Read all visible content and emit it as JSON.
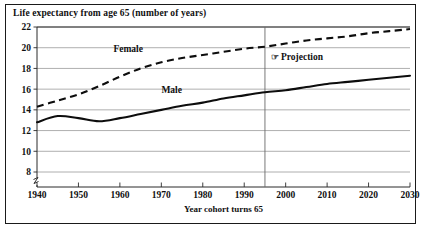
{
  "figure": {
    "title": "Life expectancy from age 65 (number of years)",
    "frame_color": "#1a1a1a",
    "background": "#ffffff"
  },
  "annotations": {
    "projection_label": "Projection",
    "projection_glyph": "☞",
    "projection_glyph_name": "pointing-hand-icon"
  },
  "chart_data": {
    "type": "line",
    "title": "Life expectancy from age 65 (number of years)",
    "xlabel": "Year cohort turns 65",
    "ylabel": "",
    "xlim": [
      1940,
      2030
    ],
    "ylim": [
      7,
      22
    ],
    "y_axis_break_below": 8,
    "grid": true,
    "legend_position": "inline-labels",
    "xticks": [
      1940,
      1950,
      1960,
      1970,
      1980,
      1990,
      2000,
      2010,
      2020,
      2030
    ],
    "xtick_labels": [
      "1940",
      "1950",
      "1960",
      "1970",
      "1980",
      "1990",
      "2000",
      "2010",
      "2020",
      "2030"
    ],
    "yticks": [
      8,
      10,
      12,
      14,
      16,
      18,
      20,
      22
    ],
    "ytick_labels": [
      "8",
      "10",
      "12",
      "14",
      "16",
      "18",
      "20",
      "22"
    ],
    "projection_divider_x": 1995,
    "series": [
      {
        "name": "Female",
        "style": "dashed",
        "label": "Female",
        "color": "#0d0d0d",
        "x": [
          1940,
          1945,
          1950,
          1955,
          1960,
          1965,
          1970,
          1975,
          1980,
          1985,
          1990,
          1995,
          2000,
          2005,
          2010,
          2015,
          2020,
          2025,
          2030
        ],
        "values": [
          14.3,
          14.9,
          15.5,
          16.3,
          17.2,
          18.0,
          18.6,
          19.0,
          19.3,
          19.6,
          19.9,
          20.1,
          20.4,
          20.7,
          20.9,
          21.1,
          21.4,
          21.6,
          21.8
        ]
      },
      {
        "name": "Male",
        "style": "solid",
        "label": "Male",
        "color": "#0d0d0d",
        "x": [
          1940,
          1945,
          1950,
          1955,
          1960,
          1965,
          1970,
          1975,
          1980,
          1985,
          1990,
          1995,
          2000,
          2005,
          2010,
          2015,
          2020,
          2025,
          2030
        ],
        "values": [
          12.8,
          13.4,
          13.2,
          12.9,
          13.2,
          13.6,
          14.0,
          14.4,
          14.7,
          15.1,
          15.4,
          15.7,
          15.9,
          16.2,
          16.5,
          16.7,
          16.9,
          17.1,
          17.3
        ]
      }
    ]
  }
}
